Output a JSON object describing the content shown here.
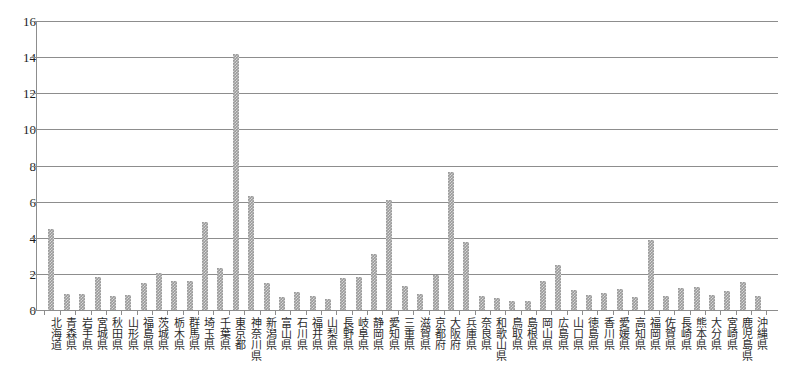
{
  "chart_data": {
    "type": "bar",
    "title": "",
    "subtitle": "",
    "xlabel": "",
    "ylabel": "",
    "ylim": [
      0,
      16
    ],
    "ytick_step": 2,
    "ytick_labels": [
      "16",
      "14",
      "12",
      "10",
      "8",
      "6",
      "4",
      "2",
      "0"
    ],
    "grid": true,
    "legend": "none",
    "bar_color": "#9a9a9a",
    "bar_pattern": "checkered-hatch",
    "axis_color": "#8d8d8d",
    "categories": [
      "北海道",
      "青森県",
      "岩手県",
      "宮城県",
      "秋田県",
      "山形県",
      "福島県",
      "茨城県",
      "栃木県",
      "群馬県",
      "埼玉県",
      "千葉県",
      "東京都",
      "神奈川県",
      "新潟県",
      "富山県",
      "石川県",
      "福井県",
      "山梨県",
      "長野県",
      "岐阜県",
      "静岡県",
      "愛知県",
      "三重県",
      "滋賀県",
      "京都府",
      "大阪府",
      "兵庫県",
      "奈良県",
      "和歌山県",
      "鳥取県",
      "島根県",
      "岡山県",
      "広島県",
      "山口県",
      "徳島県",
      "香川県",
      "愛媛県",
      "高知県",
      "福岡県",
      "佐賀県",
      "長崎県",
      "熊本県",
      "大分県",
      "宮崎県",
      "鹿児島県",
      "沖縄県"
    ],
    "values": [
      4.5,
      0.9,
      0.9,
      1.85,
      0.75,
      0.85,
      1.5,
      2.05,
      1.6,
      1.6,
      4.9,
      2.3,
      14.2,
      6.3,
      1.5,
      0.7,
      1.0,
      0.8,
      0.6,
      1.8,
      1.85,
      3.1,
      6.1,
      1.35,
      0.9,
      1.95,
      7.65,
      3.75,
      0.8,
      0.65,
      0.5,
      0.5,
      1.6,
      2.5,
      1.1,
      0.85,
      0.95,
      1.15,
      0.7,
      3.9,
      0.8,
      1.2,
      1.25,
      0.85,
      1.05,
      1.55,
      0.75
    ]
  }
}
